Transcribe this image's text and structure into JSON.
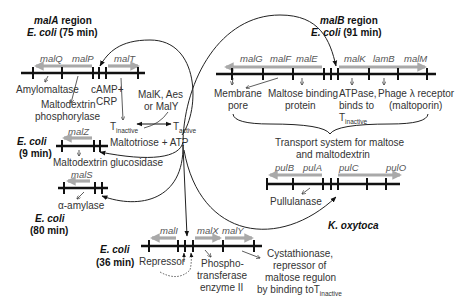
{
  "regions": {
    "malA": {
      "title_gene": "malA",
      "title_rest": " region",
      "organism": "E. coli",
      "position": " (75 min)",
      "genes": [
        "malQ",
        "malP",
        "malT"
      ],
      "products": [
        "Amylomaltase",
        "Maltodextrin",
        "phosphorylase"
      ],
      "activator": [
        "cAMP+",
        "CRP"
      ]
    },
    "malB": {
      "title_gene": "malB",
      "title_rest": " region",
      "organism": "E. coli",
      "position": " (91 min)",
      "genes": [
        "malG",
        "malF",
        "malE",
        "malK",
        "lamB",
        "malM"
      ],
      "products": {
        "membrane": [
          "Membrane",
          "pore"
        ],
        "binding": [
          "Maltose binding",
          "protein"
        ],
        "atpase": [
          "ATPase,",
          "binds to",
          "T",
          "inactive"
        ],
        "phage": [
          "Phage λ receptor",
          "(maltoporin)"
        ]
      },
      "transport": [
        "Transport system for maltose",
        "and maltodextrin"
      ]
    },
    "malZ": {
      "organism": "E. coli",
      "position": "(9 min)",
      "gene": "malZ",
      "product": "Maltodextrin glucosidase"
    },
    "malS": {
      "organism": "E. coli",
      "position": "(80 min)",
      "gene": "malS",
      "product": "α-amylase"
    },
    "malI": {
      "organism": "E. coli",
      "position": "(36 min)",
      "genes": [
        "malI",
        "malX",
        "malY"
      ],
      "products": {
        "repressor": "Repressor",
        "pts": [
          "Phospho-",
          "transferase",
          "enzyme II"
        ],
        "maly": [
          "Cystathionase,",
          "repressor of",
          "maltose regulon",
          "by binding toT",
          "inactive"
        ]
      }
    },
    "pul": {
      "organism": "K. oxytoca",
      "genes": [
        "pulB",
        "pulA",
        "pulC",
        "pulO"
      ],
      "product": "Pullulanase"
    }
  },
  "regulation": {
    "inducers": [
      "MalK, Aes",
      "or MalY"
    ],
    "t_inactive": [
      "T",
      "inactive"
    ],
    "t_active": [
      "T",
      "active"
    ],
    "effector": "Maltotriose + ATP"
  },
  "colors": {
    "gene_arrow": "#a9a9a9",
    "dna_line": "#111111",
    "text": "#333333"
  }
}
